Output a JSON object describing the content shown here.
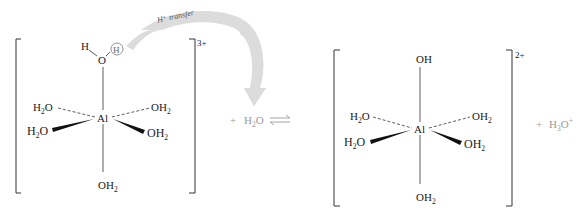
{
  "reaction": {
    "arrow_label": "H⁺ transfer",
    "equilibrium_symbol": "⇌",
    "plus": "+"
  },
  "reactant_complex": {
    "charge": "3+",
    "center": "Al",
    "top_ligand": {
      "H_left": "H",
      "O": "O",
      "H_circled": "H"
    },
    "ligands": {
      "upper_left": "H2O",
      "upper_right": "OH2",
      "lower_left": "H2O",
      "lower_right": "OH2",
      "bottom": "OH2"
    }
  },
  "water_reactant": "H2O",
  "product_complex": {
    "charge": "2+",
    "center": "Al",
    "top_ligand": "OH",
    "ligands": {
      "upper_left": "H2O",
      "upper_right": "OH2",
      "lower_left": "H2O",
      "lower_right": "OH2",
      "bottom": "OH2"
    }
  },
  "hydronium_product": "H3O+",
  "colors": {
    "ink": "#1a1a1a",
    "gray_text": "#9a9a9a",
    "arrow_fill": "#dcdcdc"
  }
}
